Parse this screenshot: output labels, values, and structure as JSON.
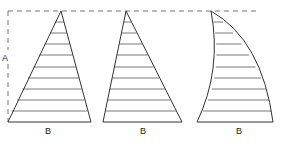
{
  "diagram": {
    "labels": {
      "height": "A",
      "base_1": "B",
      "base_2": "B",
      "base_3": "B"
    },
    "colors": {
      "stroke": "#333333",
      "hatch": "#555555",
      "dashed": "#666666",
      "background": "#ffffff"
    },
    "shapes": [
      {
        "name": "triangle-left",
        "apex": [
          61,
          11
        ],
        "base": [
          8,
          91
        ]
      },
      {
        "name": "triangle-right-skew",
        "apex": [
          126,
          11
        ],
        "base": [
          103,
          182
        ]
      },
      {
        "name": "curved-sail",
        "apex": [
          211,
          11
        ],
        "base": [
          197,
          273
        ]
      }
    ],
    "hatch_line_count": 9
  }
}
